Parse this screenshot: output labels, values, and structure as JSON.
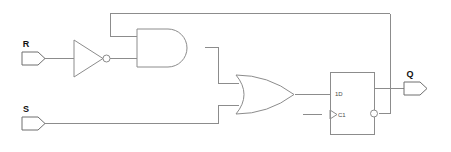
{
  "diagram": {
    "background_color": "#ffffff",
    "wire_color": "#8c8c8c",
    "label_color": "#111111",
    "width": 451,
    "height": 152
  },
  "inputs": [
    {
      "id": "r",
      "label": "R",
      "x": 22,
      "y": 58
    },
    {
      "id": "s",
      "label": "S",
      "x": 22,
      "y": 123
    }
  ],
  "outputs": [
    {
      "id": "q",
      "label": "Q",
      "x": 404,
      "y": 88
    }
  ],
  "gates": {
    "inverter": {
      "name": "NOT gate",
      "label": "",
      "x": 74,
      "y": 58
    },
    "and": {
      "name": "AND gate",
      "label": "",
      "x": 137,
      "y": 45
    },
    "or": {
      "name": "OR gate",
      "label": "",
      "x": 233,
      "y": 94
    },
    "flipflop": {
      "name": "D flip-flop",
      "data_label": "1D",
      "clock_label": "C1",
      "x": 330,
      "y": 72,
      "width": 44,
      "height": 62
    }
  },
  "nets": [
    {
      "name": "r-to-inverter"
    },
    {
      "name": "inverter-to-and"
    },
    {
      "name": "and-to-or"
    },
    {
      "name": "s-to-or"
    },
    {
      "name": "or-to-d"
    },
    {
      "name": "clock-stub"
    },
    {
      "name": "q-output"
    },
    {
      "name": "qbar-feedback-to-and"
    }
  ]
}
